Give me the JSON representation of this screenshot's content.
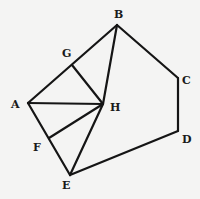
{
  "diagram": {
    "type": "geometric-figure",
    "background": "#f4f4f3",
    "line_color": "#151515",
    "points": {
      "A": {
        "x": 28,
        "y": 103,
        "label": "A",
        "lx": 11,
        "ly": 108
      },
      "B": {
        "x": 117,
        "y": 25,
        "label": "B",
        "lx": 114,
        "ly": 18
      },
      "C": {
        "x": 178,
        "y": 78,
        "label": "C",
        "lx": 182,
        "ly": 84
      },
      "D": {
        "x": 178,
        "y": 131,
        "label": "D",
        "lx": 182,
        "ly": 143
      },
      "E": {
        "x": 70,
        "y": 175,
        "label": "E",
        "lx": 62,
        "ly": 189
      },
      "F": {
        "x": 49,
        "y": 138,
        "label": "F",
        "lx": 33,
        "ly": 151
      },
      "G": {
        "x": 72,
        "y": 65,
        "label": "G",
        "lx": 62,
        "ly": 57
      },
      "H": {
        "x": 103,
        "y": 104,
        "label": "H",
        "lx": 110,
        "ly": 111
      }
    },
    "segments": [
      [
        "A",
        "B"
      ],
      [
        "B",
        "C"
      ],
      [
        "C",
        "D"
      ],
      [
        "D",
        "E"
      ],
      [
        "E",
        "A"
      ],
      [
        "A",
        "H"
      ],
      [
        "B",
        "H"
      ],
      [
        "G",
        "H"
      ],
      [
        "F",
        "H"
      ],
      [
        "E",
        "H"
      ]
    ],
    "labels": [
      "A",
      "B",
      "C",
      "D",
      "E",
      "F",
      "G",
      "H"
    ]
  }
}
